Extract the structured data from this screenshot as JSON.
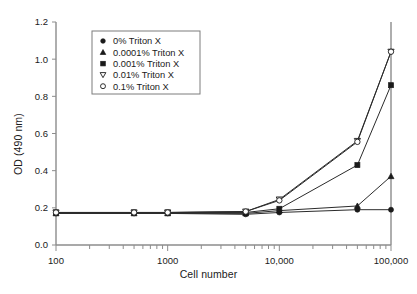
{
  "chart_data": {
    "type": "line",
    "title": "",
    "xlabel": "Cell number",
    "ylabel": "OD (490 nm)",
    "xscale": "log",
    "xlim": [
      100,
      100000
    ],
    "ylim": [
      0.0,
      1.2
    ],
    "ytick_labels": [
      "0.0",
      "0.2",
      "0.4",
      "0.6",
      "0.8",
      "1.0",
      "1.2"
    ],
    "ytick_values": [
      0.0,
      0.2,
      0.4,
      0.6,
      0.8,
      1.0,
      1.2
    ],
    "xtick_labels": [
      "100",
      "1000",
      "10,000",
      "100,000"
    ],
    "xtick_values": [
      100,
      1000,
      10000,
      100000
    ],
    "grid": false,
    "legend_position": "upper left",
    "series": [
      {
        "name": "0% Triton X",
        "marker": "filled-circle",
        "x": [
          100,
          500,
          1000,
          5000,
          10000,
          50000,
          100000
        ],
        "values": [
          0.17,
          0.17,
          0.17,
          0.165,
          0.175,
          0.19,
          0.19
        ]
      },
      {
        "name": "0.0001% Triton X",
        "marker": "filled-triangle-up",
        "x": [
          100,
          500,
          1000,
          5000,
          10000,
          50000,
          100000
        ],
        "values": [
          0.17,
          0.17,
          0.17,
          0.17,
          0.185,
          0.21,
          0.37
        ]
      },
      {
        "name": "0.001% Triton X",
        "marker": "filled-square",
        "x": [
          100,
          500,
          1000,
          5000,
          10000,
          50000,
          100000
        ],
        "values": [
          0.175,
          0.175,
          0.175,
          0.175,
          0.195,
          0.43,
          0.86
        ]
      },
      {
        "name": "0.01% Triton X",
        "marker": "open-triangle-down",
        "x": [
          100,
          500,
          1000,
          5000,
          10000,
          50000,
          100000
        ],
        "values": [
          0.175,
          0.175,
          0.175,
          0.18,
          0.245,
          0.56,
          1.04
        ]
      },
      {
        "name": "0.1% Triton X",
        "marker": "open-circle",
        "x": [
          100,
          500,
          1000,
          5000,
          10000,
          50000,
          100000
        ],
        "values": [
          0.175,
          0.175,
          0.175,
          0.18,
          0.24,
          0.555,
          1.04
        ]
      }
    ]
  }
}
